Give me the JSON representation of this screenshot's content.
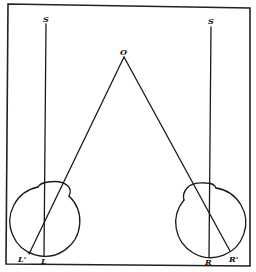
{
  "figure": {
    "type": "optics-diagram"
  },
  "labels": {
    "left_s": "S",
    "right_s": "S",
    "object": "O",
    "left_eye_axis_point": "L",
    "left_eye_convergence_point": "L'",
    "right_eye_axis_point": "R",
    "right_eye_convergence_point": "R'"
  },
  "colors": {
    "line": "#1a1a1a",
    "background": "#ffffff"
  }
}
